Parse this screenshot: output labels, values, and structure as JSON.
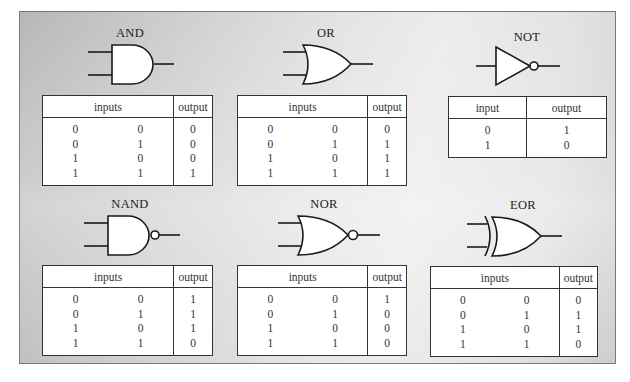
{
  "figure": {
    "gates": [
      {
        "name": "AND",
        "headers": [
          "inputs",
          "output"
        ],
        "rows": [
          [
            "0",
            "0",
            "0"
          ],
          [
            "0",
            "1",
            "0"
          ],
          [
            "1",
            "0",
            "0"
          ],
          [
            "1",
            "1",
            "1"
          ]
        ]
      },
      {
        "name": "OR",
        "headers": [
          "inputs",
          "output"
        ],
        "rows": [
          [
            "0",
            "0",
            "0"
          ],
          [
            "0",
            "1",
            "1"
          ],
          [
            "1",
            "0",
            "1"
          ],
          [
            "1",
            "1",
            "1"
          ]
        ]
      },
      {
        "name": "NOT",
        "headers": [
          "input",
          "output"
        ],
        "rows": [
          [
            "0",
            "1"
          ],
          [
            "1",
            "0"
          ]
        ]
      },
      {
        "name": "NAND",
        "headers": [
          "inputs",
          "output"
        ],
        "rows": [
          [
            "0",
            "0",
            "1"
          ],
          [
            "0",
            "1",
            "1"
          ],
          [
            "1",
            "0",
            "1"
          ],
          [
            "1",
            "1",
            "0"
          ]
        ]
      },
      {
        "name": "NOR",
        "headers": [
          "inputs",
          "output"
        ],
        "rows": [
          [
            "0",
            "0",
            "1"
          ],
          [
            "0",
            "1",
            "0"
          ],
          [
            "1",
            "0",
            "0"
          ],
          [
            "1",
            "1",
            "0"
          ]
        ]
      },
      {
        "name": "EOR",
        "headers": [
          "inputs",
          "output"
        ],
        "rows": [
          [
            "0",
            "0",
            "0"
          ],
          [
            "0",
            "1",
            "1"
          ],
          [
            "1",
            "0",
            "1"
          ],
          [
            "1",
            "1",
            "0"
          ]
        ]
      }
    ]
  },
  "colors": {
    "stroke": "#1a1a1a",
    "panel_dark": "#b7b7b7",
    "panel_light": "#ececec",
    "table_bg": "#ffffff"
  }
}
